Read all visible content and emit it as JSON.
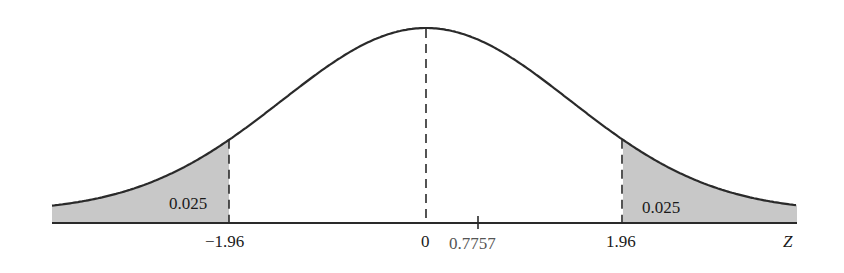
{
  "chart_data": {
    "type": "area",
    "title": "",
    "xlabel": "Z",
    "ylabel": "",
    "distribution": "standard normal",
    "mean": 0,
    "std": 1,
    "critical_values": [
      -1.96,
      1.96
    ],
    "tail_areas": [
      {
        "side": "left",
        "from": "-inf",
        "to": -1.96,
        "area": 0.025,
        "label": "0.025"
      },
      {
        "side": "right",
        "from": 1.96,
        "to": "inf",
        "area": 0.025,
        "label": "0.025"
      }
    ],
    "reference_lines": [
      {
        "x": -1.96,
        "style": "dashed"
      },
      {
        "x": 0,
        "style": "dashed"
      },
      {
        "x": 1.96,
        "style": "dashed"
      }
    ],
    "tick_labels": [
      "-1.96",
      "0",
      "0.7757",
      "1.96"
    ],
    "marked_value": {
      "x": 0.7757,
      "label": "0.7757",
      "style": "tick"
    },
    "grid": false,
    "legend": null
  },
  "labels": {
    "left_tail": "0.025",
    "right_tail": "0.025",
    "tick_neg": "−1.96",
    "tick_zero": "0",
    "tick_marked": "0.7757",
    "tick_pos": "1.96",
    "axis_var": "Z"
  },
  "colors": {
    "curve": "#2a2a2a",
    "fill": "#c8c8c8",
    "axis": "#2a2a2a"
  }
}
